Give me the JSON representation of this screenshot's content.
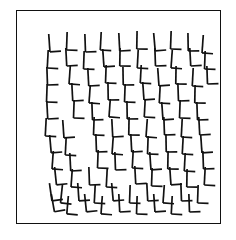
{
  "figure": {
    "title": "L-shape array visual search stimulus",
    "background_color": "#ffffff",
    "frame": {
      "stroke_color": "#111111",
      "stroke_width": 1.5,
      "x": 16,
      "y": 10,
      "width": 205,
      "height": 214
    },
    "glyph": {
      "name": "L-shape",
      "stroke_color": "#111111",
      "stroke_width": 1.7,
      "arm_vertical_length": 14,
      "arm_horizontal_length": 11,
      "overshoot_top": 4
    },
    "grid": {
      "columns": 10,
      "rows": 11,
      "count": 104,
      "origin_x": 47,
      "origin_y": 37,
      "step_x": 17.2,
      "step_y": 16.4
    }
  },
  "chart_data": {
    "type": "scatter",
    "title": "L-shape array visual search stimulus",
    "xlabel": "",
    "ylabel": "",
    "xlim": [
      16,
      221
    ],
    "ylim": [
      10,
      224
    ],
    "grid": false,
    "legend": null,
    "items": [
      {
        "x": 49,
        "y": 38,
        "rot": -4
      },
      {
        "x": 67,
        "y": 36,
        "rot": 2
      },
      {
        "x": 85,
        "y": 38,
        "rot": -2
      },
      {
        "x": 101,
        "y": 36,
        "rot": 3
      },
      {
        "x": 119,
        "y": 37,
        "rot": -3
      },
      {
        "x": 137,
        "y": 35,
        "rot": 1
      },
      {
        "x": 154,
        "y": 37,
        "rot": -5
      },
      {
        "x": 171,
        "y": 35,
        "rot": 2
      },
      {
        "x": 188,
        "y": 37,
        "rot": -1
      },
      {
        "x": 203,
        "y": 39,
        "rot": 4
      },
      {
        "x": 48,
        "y": 54,
        "rot": 3
      },
      {
        "x": 66,
        "y": 52,
        "rot": -3
      },
      {
        "x": 84,
        "y": 55,
        "rot": 2
      },
      {
        "x": 103,
        "y": 53,
        "rot": -4
      },
      {
        "x": 120,
        "y": 52,
        "rot": 1
      },
      {
        "x": 138,
        "y": 54,
        "rot": 3
      },
      {
        "x": 155,
        "y": 52,
        "rot": -2
      },
      {
        "x": 172,
        "y": 54,
        "rot": 4
      },
      {
        "x": 190,
        "y": 52,
        "rot": -3
      },
      {
        "x": 205,
        "y": 55,
        "rot": 2
      },
      {
        "x": 47,
        "y": 71,
        "rot": -2
      },
      {
        "x": 70,
        "y": 70,
        "rot": 4
      },
      {
        "x": 88,
        "y": 72,
        "rot": -3
      },
      {
        "x": 106,
        "y": 69,
        "rot": 2
      },
      {
        "x": 123,
        "y": 71,
        "rot": -1
      },
      {
        "x": 141,
        "y": 69,
        "rot": 3
      },
      {
        "x": 158,
        "y": 72,
        "rot": -4
      },
      {
        "x": 176,
        "y": 70,
        "rot": 1
      },
      {
        "x": 193,
        "y": 72,
        "rot": 3
      },
      {
        "x": 207,
        "y": 70,
        "rot": -2
      },
      {
        "x": 47,
        "y": 88,
        "rot": 2
      },
      {
        "x": 72,
        "y": 87,
        "rot": -3
      },
      {
        "x": 90,
        "y": 89,
        "rot": 4
      },
      {
        "x": 108,
        "y": 86,
        "rot": -1
      },
      {
        "x": 125,
        "y": 88,
        "rot": 2
      },
      {
        "x": 143,
        "y": 86,
        "rot": -4
      },
      {
        "x": 160,
        "y": 89,
        "rot": 3
      },
      {
        "x": 178,
        "y": 87,
        "rot": -2
      },
      {
        "x": 195,
        "y": 89,
        "rot": 1
      },
      {
        "x": 47,
        "y": 105,
        "rot": -3
      },
      {
        "x": 74,
        "y": 104,
        "rot": 2
      },
      {
        "x": 92,
        "y": 106,
        "rot": -2
      },
      {
        "x": 110,
        "y": 103,
        "rot": 4
      },
      {
        "x": 127,
        "y": 105,
        "rot": -1
      },
      {
        "x": 145,
        "y": 103,
        "rot": 3
      },
      {
        "x": 162,
        "y": 106,
        "rot": -4
      },
      {
        "x": 180,
        "y": 104,
        "rot": 2
      },
      {
        "x": 197,
        "y": 106,
        "rot": -2
      },
      {
        "x": 46,
        "y": 122,
        "rot": 3
      },
      {
        "x": 63,
        "y": 124,
        "rot": -4
      },
      {
        "x": 94,
        "y": 121,
        "rot": 2
      },
      {
        "x": 112,
        "y": 123,
        "rot": -3
      },
      {
        "x": 129,
        "y": 121,
        "rot": 1
      },
      {
        "x": 147,
        "y": 123,
        "rot": 4
      },
      {
        "x": 164,
        "y": 121,
        "rot": -2
      },
      {
        "x": 182,
        "y": 123,
        "rot": 3
      },
      {
        "x": 199,
        "y": 121,
        "rot": -3
      },
      {
        "x": 50,
        "y": 139,
        "rot": -5
      },
      {
        "x": 66,
        "y": 141,
        "rot": 3
      },
      {
        "x": 96,
        "y": 138,
        "rot": -2
      },
      {
        "x": 113,
        "y": 140,
        "rot": 4
      },
      {
        "x": 131,
        "y": 138,
        "rot": -3
      },
      {
        "x": 148,
        "y": 140,
        "rot": 2
      },
      {
        "x": 166,
        "y": 138,
        "rot": -1
      },
      {
        "x": 183,
        "y": 140,
        "rot": 3
      },
      {
        "x": 201,
        "y": 139,
        "rot": -4
      },
      {
        "x": 53,
        "y": 155,
        "rot": 4
      },
      {
        "x": 70,
        "y": 157,
        "rot": -3
      },
      {
        "x": 98,
        "y": 154,
        "rot": 2
      },
      {
        "x": 115,
        "y": 156,
        "rot": -2
      },
      {
        "x": 133,
        "y": 154,
        "rot": 3
      },
      {
        "x": 150,
        "y": 156,
        "rot": -4
      },
      {
        "x": 168,
        "y": 155,
        "rot": 1
      },
      {
        "x": 185,
        "y": 157,
        "rot": 3
      },
      {
        "x": 203,
        "y": 155,
        "rot": -2
      },
      {
        "x": 55,
        "y": 171,
        "rot": -6
      },
      {
        "x": 72,
        "y": 173,
        "rot": 4
      },
      {
        "x": 89,
        "y": 171,
        "rot": -2
      },
      {
        "x": 107,
        "y": 173,
        "rot": 3
      },
      {
        "x": 135,
        "y": 170,
        "rot": -3
      },
      {
        "x": 152,
        "y": 172,
        "rot": 2
      },
      {
        "x": 170,
        "y": 171,
        "rot": -4
      },
      {
        "x": 187,
        "y": 173,
        "rot": 1
      },
      {
        "x": 205,
        "y": 171,
        "rot": 3
      },
      {
        "x": 50,
        "y": 187,
        "rot": -8
      },
      {
        "x": 62,
        "y": 189,
        "rot": 6
      },
      {
        "x": 78,
        "y": 187,
        "rot": -4
      },
      {
        "x": 95,
        "y": 189,
        "rot": 3
      },
      {
        "x": 112,
        "y": 187,
        "rot": -5
      },
      {
        "x": 130,
        "y": 189,
        "rot": 2
      },
      {
        "x": 147,
        "y": 187,
        "rot": -3
      },
      {
        "x": 164,
        "y": 189,
        "rot": 4
      },
      {
        "x": 181,
        "y": 187,
        "rot": -2
      },
      {
        "x": 198,
        "y": 189,
        "rot": 2
      },
      {
        "x": 52,
        "y": 198,
        "rot": -10
      },
      {
        "x": 68,
        "y": 200,
        "rot": 5
      },
      {
        "x": 85,
        "y": 198,
        "rot": -6
      },
      {
        "x": 102,
        "y": 200,
        "rot": 4
      },
      {
        "x": 119,
        "y": 198,
        "rot": -3
      },
      {
        "x": 137,
        "y": 200,
        "rot": 2
      },
      {
        "x": 154,
        "y": 198,
        "rot": -4
      },
      {
        "x": 172,
        "y": 200,
        "rot": 3
      },
      {
        "x": 189,
        "y": 198,
        "rot": -2
      }
    ]
  }
}
